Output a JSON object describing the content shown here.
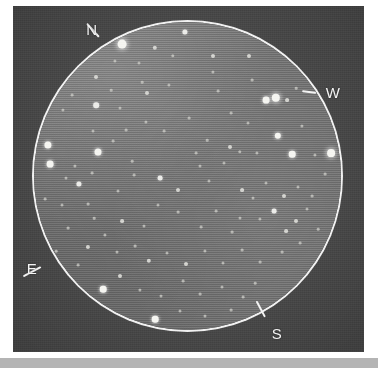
{
  "figure": {
    "kind": "eyepiece-field-of-view-star-chart",
    "background_color": "#4c4c4c",
    "field_color": "#787878",
    "circle_color": "#f2f2f2",
    "label_color": "#f4f4f4"
  },
  "compass": {
    "items": [
      {
        "id": "north",
        "label": "N",
        "label_x": 92,
        "label_y": 29,
        "tick_x": 99,
        "tick_y": 36,
        "tick_angle": 48,
        "tick_len": 18
      },
      {
        "id": "west",
        "label": "W",
        "label_x": 333,
        "label_y": 92,
        "tick_x": 316,
        "tick_y": 92,
        "tick_angle": 8,
        "tick_len": 14
      },
      {
        "id": "east",
        "label": "E",
        "label_x": 32,
        "label_y": 268,
        "tick_x": 41,
        "tick_y": 266,
        "tick_angle": -28,
        "tick_len": 20
      },
      {
        "id": "south",
        "label": "S",
        "label_x": 277,
        "label_y": 333,
        "tick_x": 265,
        "tick_y": 316,
        "tick_angle": 62,
        "tick_len": 18
      }
    ]
  },
  "field": {
    "center_x": 187,
    "center_y": 176,
    "radius": 154,
    "ring_width": 2
  },
  "chart_data": {
    "type": "scatter",
    "title": "",
    "xlabel": "",
    "ylabel": "",
    "units": "pixels in original 378x368 scan",
    "stars": [
      {
        "x": 155,
        "y": 48,
        "mag": 4,
        "size": 2.2
      },
      {
        "x": 122,
        "y": 44,
        "mag": 1,
        "size": 4.4
      },
      {
        "x": 185,
        "y": 32,
        "mag": 3,
        "size": 2.6
      },
      {
        "x": 213,
        "y": 56,
        "mag": 4,
        "size": 2.0
      },
      {
        "x": 249,
        "y": 56,
        "mag": 4,
        "size": 2.0
      },
      {
        "x": 213,
        "y": 72,
        "mag": 5,
        "size": 1.6
      },
      {
        "x": 173,
        "y": 56,
        "mag": 5,
        "size": 1.7
      },
      {
        "x": 115,
        "y": 61,
        "mag": 5,
        "size": 1.6
      },
      {
        "x": 96,
        "y": 77,
        "mag": 4,
        "size": 2.0
      },
      {
        "x": 139,
        "y": 63,
        "mag": 5,
        "size": 1.5
      },
      {
        "x": 169,
        "y": 85,
        "mag": 5,
        "size": 1.6
      },
      {
        "x": 147,
        "y": 93,
        "mag": 4,
        "size": 2.0
      },
      {
        "x": 96,
        "y": 105,
        "mag": 3,
        "size": 2.8
      },
      {
        "x": 120,
        "y": 108,
        "mag": 5,
        "size": 1.5
      },
      {
        "x": 146,
        "y": 122,
        "mag": 5,
        "size": 1.6
      },
      {
        "x": 126,
        "y": 130,
        "mag": 5,
        "size": 1.4
      },
      {
        "x": 93,
        "y": 131,
        "mag": 5,
        "size": 1.5
      },
      {
        "x": 63,
        "y": 110,
        "mag": 5,
        "size": 1.6
      },
      {
        "x": 72,
        "y": 95,
        "mag": 5,
        "size": 1.4
      },
      {
        "x": 98,
        "y": 152,
        "mag": 2,
        "size": 3.5
      },
      {
        "x": 113,
        "y": 141,
        "mag": 5,
        "size": 1.4
      },
      {
        "x": 75,
        "y": 166,
        "mag": 5,
        "size": 1.6
      },
      {
        "x": 48,
        "y": 145,
        "mag": 2,
        "size": 3.6
      },
      {
        "x": 50,
        "y": 164,
        "mag": 2,
        "size": 3.4
      },
      {
        "x": 79,
        "y": 184,
        "mag": 3,
        "size": 2.6
      },
      {
        "x": 92,
        "y": 173,
        "mag": 5,
        "size": 1.4
      },
      {
        "x": 66,
        "y": 178,
        "mag": 5,
        "size": 1.5
      },
      {
        "x": 62,
        "y": 205,
        "mag": 5,
        "size": 1.5
      },
      {
        "x": 88,
        "y": 204,
        "mag": 5,
        "size": 1.4
      },
      {
        "x": 45,
        "y": 199,
        "mag": 5,
        "size": 1.4
      },
      {
        "x": 118,
        "y": 191,
        "mag": 5,
        "size": 1.5
      },
      {
        "x": 134,
        "y": 175,
        "mag": 5,
        "size": 1.4
      },
      {
        "x": 160,
        "y": 178,
        "mag": 3,
        "size": 2.4
      },
      {
        "x": 178,
        "y": 190,
        "mag": 4,
        "size": 2.0
      },
      {
        "x": 200,
        "y": 166,
        "mag": 5,
        "size": 1.5
      },
      {
        "x": 209,
        "y": 181,
        "mag": 5,
        "size": 1.5
      },
      {
        "x": 196,
        "y": 153,
        "mag": 5,
        "size": 1.4
      },
      {
        "x": 230,
        "y": 147,
        "mag": 4,
        "size": 2.0
      },
      {
        "x": 240,
        "y": 152,
        "mag": 5,
        "size": 1.7
      },
      {
        "x": 224,
        "y": 163,
        "mag": 5,
        "size": 1.5
      },
      {
        "x": 257,
        "y": 153,
        "mag": 5,
        "size": 1.6
      },
      {
        "x": 278,
        "y": 136,
        "mag": 2,
        "size": 3.2
      },
      {
        "x": 292,
        "y": 154,
        "mag": 2,
        "size": 3.3
      },
      {
        "x": 302,
        "y": 126,
        "mag": 5,
        "size": 1.6
      },
      {
        "x": 266,
        "y": 100,
        "mag": 2,
        "size": 3.4
      },
      {
        "x": 276,
        "y": 98,
        "mag": 1,
        "size": 4.2
      },
      {
        "x": 315,
        "y": 155,
        "mag": 5,
        "size": 1.6
      },
      {
        "x": 331,
        "y": 153,
        "mag": 1,
        "size": 3.9
      },
      {
        "x": 287,
        "y": 100,
        "mag": 4,
        "size": 1.9
      },
      {
        "x": 248,
        "y": 123,
        "mag": 5,
        "size": 1.5
      },
      {
        "x": 231,
        "y": 113,
        "mag": 5,
        "size": 1.4
      },
      {
        "x": 218,
        "y": 91,
        "mag": 5,
        "size": 1.4
      },
      {
        "x": 189,
        "y": 118,
        "mag": 5,
        "size": 1.4
      },
      {
        "x": 164,
        "y": 131,
        "mag": 5,
        "size": 1.4
      },
      {
        "x": 242,
        "y": 190,
        "mag": 4,
        "size": 1.9
      },
      {
        "x": 253,
        "y": 198,
        "mag": 5,
        "size": 1.5
      },
      {
        "x": 266,
        "y": 183,
        "mag": 5,
        "size": 1.5
      },
      {
        "x": 284,
        "y": 196,
        "mag": 4,
        "size": 2.0
      },
      {
        "x": 298,
        "y": 187,
        "mag": 5,
        "size": 1.5
      },
      {
        "x": 312,
        "y": 196,
        "mag": 5,
        "size": 1.4
      },
      {
        "x": 274,
        "y": 211,
        "mag": 3,
        "size": 2.4
      },
      {
        "x": 260,
        "y": 219,
        "mag": 5,
        "size": 1.6
      },
      {
        "x": 296,
        "y": 221,
        "mag": 4,
        "size": 2.0
      },
      {
        "x": 307,
        "y": 209,
        "mag": 5,
        "size": 1.5
      },
      {
        "x": 286,
        "y": 231,
        "mag": 4,
        "size": 1.9
      },
      {
        "x": 240,
        "y": 218,
        "mag": 5,
        "size": 1.5
      },
      {
        "x": 232,
        "y": 232,
        "mag": 5,
        "size": 1.4
      },
      {
        "x": 216,
        "y": 211,
        "mag": 5,
        "size": 1.4
      },
      {
        "x": 201,
        "y": 227,
        "mag": 5,
        "size": 1.4
      },
      {
        "x": 178,
        "y": 212,
        "mag": 5,
        "size": 1.4
      },
      {
        "x": 158,
        "y": 205,
        "mag": 5,
        "size": 1.5
      },
      {
        "x": 144,
        "y": 226,
        "mag": 5,
        "size": 1.5
      },
      {
        "x": 122,
        "y": 221,
        "mag": 4,
        "size": 1.9
      },
      {
        "x": 105,
        "y": 235,
        "mag": 5,
        "size": 1.6
      },
      {
        "x": 88,
        "y": 247,
        "mag": 4,
        "size": 2.1
      },
      {
        "x": 117,
        "y": 252,
        "mag": 5,
        "size": 1.5
      },
      {
        "x": 135,
        "y": 246,
        "mag": 5,
        "size": 1.4
      },
      {
        "x": 149,
        "y": 261,
        "mag": 4,
        "size": 2.2
      },
      {
        "x": 167,
        "y": 253,
        "mag": 5,
        "size": 1.5
      },
      {
        "x": 186,
        "y": 264,
        "mag": 4,
        "size": 2.0
      },
      {
        "x": 205,
        "y": 251,
        "mag": 5,
        "size": 1.6
      },
      {
        "x": 223,
        "y": 263,
        "mag": 5,
        "size": 1.5
      },
      {
        "x": 242,
        "y": 250,
        "mag": 5,
        "size": 1.4
      },
      {
        "x": 260,
        "y": 262,
        "mag": 5,
        "size": 1.4
      },
      {
        "x": 282,
        "y": 252,
        "mag": 5,
        "size": 1.4
      },
      {
        "x": 300,
        "y": 243,
        "mag": 5,
        "size": 1.4
      },
      {
        "x": 120,
        "y": 276,
        "mag": 4,
        "size": 2.0
      },
      {
        "x": 103,
        "y": 289,
        "mag": 2,
        "size": 3.3
      },
      {
        "x": 140,
        "y": 290,
        "mag": 5,
        "size": 1.6
      },
      {
        "x": 161,
        "y": 296,
        "mag": 5,
        "size": 1.5
      },
      {
        "x": 183,
        "y": 281,
        "mag": 5,
        "size": 1.4
      },
      {
        "x": 200,
        "y": 294,
        "mag": 5,
        "size": 1.4
      },
      {
        "x": 222,
        "y": 287,
        "mag": 5,
        "size": 1.5
      },
      {
        "x": 243,
        "y": 297,
        "mag": 5,
        "size": 1.4
      },
      {
        "x": 155,
        "y": 319,
        "mag": 2,
        "size": 3.3
      },
      {
        "x": 180,
        "y": 311,
        "mag": 5,
        "size": 1.5
      },
      {
        "x": 205,
        "y": 316,
        "mag": 5,
        "size": 1.5
      },
      {
        "x": 231,
        "y": 310,
        "mag": 5,
        "size": 1.4
      },
      {
        "x": 68,
        "y": 228,
        "mag": 5,
        "size": 1.4
      },
      {
        "x": 78,
        "y": 265,
        "mag": 5,
        "size": 1.4
      },
      {
        "x": 56,
        "y": 251,
        "mag": 5,
        "size": 1.3
      },
      {
        "x": 94,
        "y": 218,
        "mag": 5,
        "size": 1.3
      },
      {
        "x": 325,
        "y": 174,
        "mag": 5,
        "size": 1.4
      },
      {
        "x": 318,
        "y": 229,
        "mag": 5,
        "size": 1.3
      },
      {
        "x": 255,
        "y": 283,
        "mag": 5,
        "size": 1.3
      },
      {
        "x": 86,
        "y": 310,
        "mag": 5,
        "size": 1.3
      },
      {
        "x": 132,
        "y": 161,
        "mag": 5,
        "size": 1.3
      },
      {
        "x": 207,
        "y": 140,
        "mag": 5,
        "size": 1.3
      },
      {
        "x": 252,
        "y": 80,
        "mag": 5,
        "size": 1.4
      },
      {
        "x": 296,
        "y": 88,
        "mag": 5,
        "size": 1.3
      },
      {
        "x": 142,
        "y": 82,
        "mag": 5,
        "size": 1.3
      },
      {
        "x": 111,
        "y": 90,
        "mag": 5,
        "size": 1.3
      }
    ]
  }
}
